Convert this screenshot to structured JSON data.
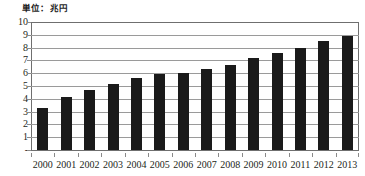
{
  "chart_data": {
    "type": "bar",
    "title": "単位：兆円",
    "xlabel": "",
    "ylabel": "",
    "ylim": [
      0,
      10
    ],
    "ytick_labels": [
      "10",
      "9",
      "8",
      "7",
      "6",
      "5",
      "4",
      "3",
      "2",
      "1",
      "-"
    ],
    "ytick_values": [
      10,
      9,
      8,
      7,
      6,
      5,
      4,
      3,
      2,
      1,
      0
    ],
    "grid": true,
    "legend": "none",
    "bar_color": "#1a1a1a",
    "categories": [
      "2000",
      "2001",
      "2002",
      "2003",
      "2004",
      "2005",
      "2006",
      "2007",
      "2008",
      "2009",
      "2010",
      "2011",
      "2012",
      "2013"
    ],
    "values": [
      3.3,
      4.15,
      4.7,
      5.15,
      5.6,
      5.9,
      6.05,
      6.35,
      6.65,
      7.15,
      7.55,
      7.95,
      8.5,
      8.9
    ]
  }
}
